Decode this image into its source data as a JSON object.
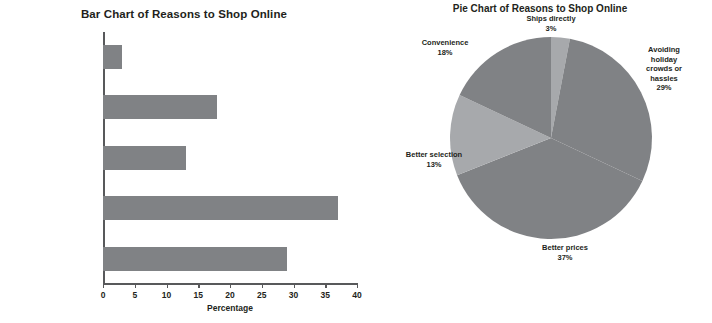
{
  "chart_data": [
    {
      "type": "bar",
      "orientation": "horizontal",
      "title": "Bar Chart of Reasons to Shop Online",
      "xlabel": "Percentage",
      "ylabel": "Main Reason",
      "categories": [
        "Avoiding holiday\ncrowds or hassles",
        "Better prices",
        "Better selection",
        "Convenience",
        "Ships directly"
      ],
      "values": [
        29,
        37,
        13,
        18,
        3
      ],
      "xlim": [
        0,
        40
      ],
      "xticks": [
        0,
        5,
        10,
        15,
        20,
        25,
        30,
        35,
        40
      ],
      "xtick_labels": [
        "0",
        "5",
        "10",
        "15",
        "20",
        "25",
        "30",
        "35",
        "40"
      ],
      "grid": false,
      "legend": "none",
      "bar_color": "#808285"
    },
    {
      "type": "pie",
      "title": "Pie Chart of Reasons to Shop Online",
      "start_angle_deg": 0,
      "direction": "clockwise",
      "labels": [
        "Ships directly",
        "Avoiding holiday\ncrowds or hassles",
        "Better prices",
        "Better selection",
        "Convenience"
      ],
      "values": [
        3,
        29,
        37,
        13,
        18
      ],
      "percent_labels": [
        "3%",
        "29%",
        "37%",
        "13%",
        "18%"
      ],
      "colors": [
        "#a7a9ac",
        "#808285",
        "#808285",
        "#a7a9ac",
        "#808285"
      ],
      "legend": "none"
    }
  ],
  "bar": {
    "title": "Bar Chart of Reasons to Shop Online",
    "x_axis_title": "Percentage",
    "y_axis_title": "Main Reason",
    "categories": [
      {
        "label": "Ships directly",
        "value": 3
      },
      {
        "label": "Convenience",
        "value": 18
      },
      {
        "label": "Better selection",
        "value": 13
      },
      {
        "label": "Better prices",
        "value": 37
      },
      {
        "label": "Avoiding holiday\ncrowds or hassles",
        "value": 29
      }
    ],
    "xticks": [
      "0",
      "5",
      "10",
      "15",
      "20",
      "25",
      "30",
      "35",
      "40"
    ]
  },
  "pie": {
    "title": "Pie Chart of Reasons to Shop Online",
    "slices": [
      {
        "label": "Ships directly",
        "percent": "3%",
        "value": 3
      },
      {
        "label": "Avoiding holiday\ncrowds or hassles",
        "percent": "29%",
        "value": 29
      },
      {
        "label": "Better prices",
        "percent": "37%",
        "value": 37
      },
      {
        "label": "Better selection",
        "percent": "13%",
        "value": 13
      },
      {
        "label": "Convenience",
        "percent": "18%",
        "value": 18
      }
    ]
  },
  "colors": {
    "bar_fill": "#808285",
    "pie_dark": "#808285",
    "pie_light": "#a7a9ac",
    "axis": "#58595b",
    "text": "#231f20"
  }
}
